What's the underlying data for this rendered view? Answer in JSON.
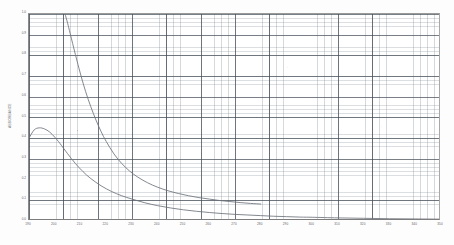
{
  "chart_data": {
    "type": "line",
    "title": "",
    "xlabel": "WAVELENGTH (nm)",
    "ylabel": "ABSORBANCE",
    "xlim": [
      190,
      350
    ],
    "ylim": [
      0.0,
      1.0
    ],
    "grid": true,
    "grid_major_x_step": 10,
    "grid_minor_x_step": 2,
    "grid_major_y_step": 0.1,
    "grid_minor_y_step": 0.02,
    "legend": "none",
    "x_tick_labels": [
      "190",
      "200",
      "210",
      "220",
      "230",
      "240",
      "250",
      "260",
      "270",
      "280",
      "290",
      "300",
      "310",
      "320",
      "330",
      "340",
      "350"
    ],
    "x_tick_values": [
      190,
      200,
      210,
      220,
      230,
      240,
      250,
      260,
      270,
      280,
      290,
      300,
      310,
      320,
      330,
      340,
      350
    ],
    "y_tick_labels": [
      "0.0",
      "0.1",
      "0.2",
      "0.3",
      "0.4",
      "0.5",
      "0.6",
      "0.7",
      "0.8",
      "0.9",
      "1.0"
    ],
    "y_tick_values": [
      0.0,
      0.1,
      0.2,
      0.3,
      0.4,
      0.5,
      0.6,
      0.7,
      0.8,
      0.9,
      1.0
    ],
    "series": [
      {
        "name": "Lower trace",
        "color": "#6d737b",
        "x": [
          190,
          192,
          194,
          196,
          198,
          200,
          202,
          205,
          208,
          211,
          214,
          218,
          222,
          226,
          230,
          235,
          240,
          245,
          250,
          255,
          260,
          265,
          270,
          275,
          280,
          285,
          290,
          295,
          300,
          310,
          320,
          330,
          340,
          350
        ],
        "y": [
          0.4,
          0.44,
          0.45,
          0.445,
          0.43,
          0.405,
          0.375,
          0.325,
          0.278,
          0.238,
          0.205,
          0.17,
          0.143,
          0.122,
          0.106,
          0.088,
          0.074,
          0.063,
          0.054,
          0.047,
          0.041,
          0.036,
          0.032,
          0.029,
          0.026,
          0.023,
          0.021,
          0.019,
          0.018,
          0.015,
          0.013,
          0.011,
          0.01,
          0.009
        ]
      },
      {
        "name": "Upper trace",
        "color": "#6d737b",
        "x": [
          204,
          205,
          206,
          208,
          210,
          212,
          214,
          216,
          218,
          220,
          223,
          226,
          229,
          232,
          236,
          240,
          244,
          248,
          252,
          256,
          260,
          264,
          268,
          272,
          276,
          280
        ],
        "y": [
          1.0,
          0.955,
          0.905,
          0.805,
          0.71,
          0.625,
          0.552,
          0.488,
          0.432,
          0.384,
          0.324,
          0.278,
          0.242,
          0.214,
          0.185,
          0.163,
          0.146,
          0.133,
          0.122,
          0.113,
          0.106,
          0.099,
          0.094,
          0.089,
          0.085,
          0.082
        ]
      }
    ],
    "annotations": [
      {
        "note": "peak of lower trace",
        "x": 194,
        "y": 0.45
      }
    ]
  }
}
